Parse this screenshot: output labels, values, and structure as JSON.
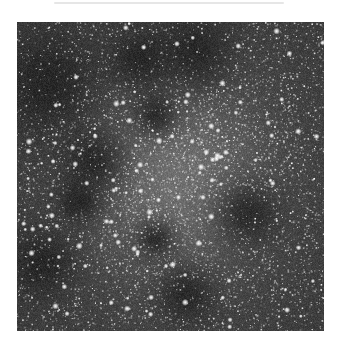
{
  "image": {
    "subject": "dense star field with central star cluster and dark dust lanes",
    "frame": {
      "x": 17,
      "y": 22,
      "width": 307,
      "height": 309
    },
    "background_color": "#3a3a3a",
    "cluster_center": {
      "x": 0.52,
      "y": 0.5
    },
    "cluster_radius": 0.22,
    "dark_lanes": [
      {
        "x": 0.1,
        "y": 0.2,
        "r": 0.16
      },
      {
        "x": 0.25,
        "y": 0.45,
        "r": 0.1
      },
      {
        "x": 0.4,
        "y": 0.12,
        "r": 0.1
      },
      {
        "x": 0.45,
        "y": 0.3,
        "r": 0.07
      },
      {
        "x": 0.2,
        "y": 0.58,
        "r": 0.07
      },
      {
        "x": 0.45,
        "y": 0.7,
        "r": 0.06
      },
      {
        "x": 0.58,
        "y": 0.1,
        "r": 0.12
      },
      {
        "x": 0.08,
        "y": 0.78,
        "r": 0.1
      },
      {
        "x": 0.75,
        "y": 0.62,
        "r": 0.1
      },
      {
        "x": 0.55,
        "y": 0.88,
        "r": 0.09
      }
    ],
    "star_count": 5200,
    "bright_star_count": 140
  }
}
